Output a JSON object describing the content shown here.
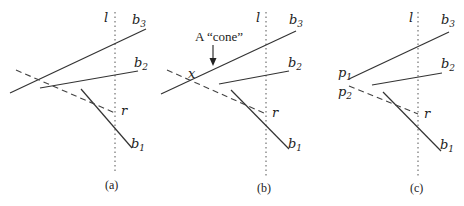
{
  "figure": {
    "panels": [
      {
        "id": "a",
        "caption": "(a)",
        "line_l_label": "l",
        "segments": [
          {
            "name": "b3",
            "label": "b",
            "sub": "3"
          },
          {
            "name": "b2",
            "label": "b",
            "sub": "2"
          },
          {
            "name": "b1",
            "label": "b",
            "sub": "1"
          }
        ],
        "ray_label": "r"
      },
      {
        "id": "b",
        "caption": "(b)",
        "line_l_label": "l",
        "segments": [
          {
            "name": "b3",
            "label": "b",
            "sub": "3"
          },
          {
            "name": "b2",
            "label": "b",
            "sub": "2"
          },
          {
            "name": "b1",
            "label": "b",
            "sub": "1"
          }
        ],
        "ray_label": "r",
        "point_label": "x",
        "annotation": "A “cone”"
      },
      {
        "id": "c",
        "caption": "(c)",
        "line_l_label": "l",
        "segments": [
          {
            "name": "b3",
            "label": "b",
            "sub": "3"
          },
          {
            "name": "b2",
            "label": "b",
            "sub": "2"
          },
          {
            "name": "b1",
            "label": "b",
            "sub": "1"
          }
        ],
        "ray_label": "r",
        "endpoints": [
          {
            "label": "p",
            "sub": "1"
          },
          {
            "label": "p",
            "sub": "2"
          }
        ]
      }
    ]
  }
}
